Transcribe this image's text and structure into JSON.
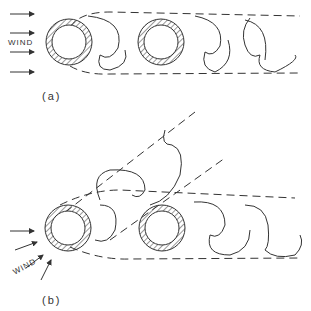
{
  "diagram": {
    "panel_a": {
      "caption": "(a)",
      "wind_label": "WIND"
    },
    "panel_b": {
      "caption": "(b)",
      "wind_label": "WIND"
    },
    "colors": {
      "line": "#333333",
      "background": "#ffffff"
    }
  }
}
